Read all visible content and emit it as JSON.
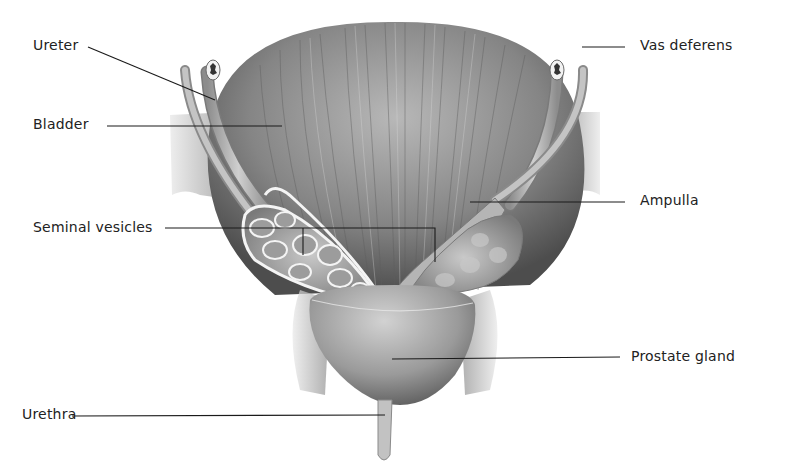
{
  "diagram": {
    "labels": [
      {
        "id": "ureter",
        "text": "Ureter",
        "x": 33,
        "y": 38
      },
      {
        "id": "bladder",
        "text": "Bladder",
        "x": 33,
        "y": 117
      },
      {
        "id": "seminal-vesicles",
        "text": "Seminal vesicles",
        "x": 33,
        "y": 221
      },
      {
        "id": "urethra",
        "text": "Urethra",
        "x": 22,
        "y": 407
      },
      {
        "id": "vas-deferens",
        "text": "Vas deferens",
        "x": 640,
        "y": 38
      },
      {
        "id": "ampulla",
        "text": "Ampulla",
        "x": 640,
        "y": 193
      },
      {
        "id": "prostate-gland",
        "text": "Prostate gland",
        "x": 632,
        "y": 350
      }
    ],
    "colors": {
      "label_text": "#222222",
      "leader_line": "#1a1a1a",
      "tissue_dark": "#4a4a4a",
      "tissue_mid": "#8a8a8a",
      "tissue_light": "#c8c8c8",
      "background": "#ffffff"
    }
  }
}
